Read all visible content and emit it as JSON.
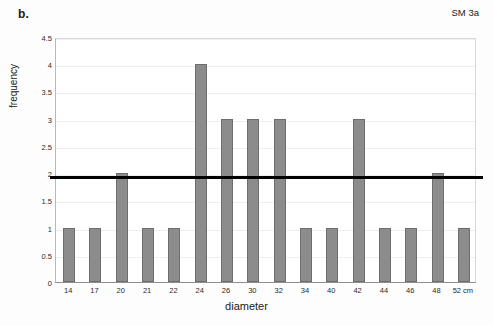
{
  "figure": {
    "panel_label": "b.",
    "series_tag": "SM 3a"
  },
  "chart_data": {
    "type": "bar",
    "title": "",
    "subtitle": "",
    "xlabel": "diameter",
    "ylabel": "frequency",
    "categories": [
      "14",
      "17",
      "20",
      "21",
      "22",
      "24",
      "26",
      "30",
      "32",
      "34",
      "40",
      "42",
      "44",
      "46",
      "48",
      "52 cm"
    ],
    "values": [
      1,
      1,
      2,
      1,
      1,
      4,
      3,
      3,
      3,
      1,
      1,
      3,
      1,
      1,
      2,
      1
    ],
    "ylim": [
      0,
      4.5
    ],
    "yticks": [
      0,
      0.5,
      1,
      1.5,
      2,
      2.5,
      3,
      3.5,
      4,
      4.5
    ],
    "ytick_labels": [
      "0",
      "0.5",
      "1",
      "1.5",
      "2",
      "2.5",
      "3",
      "3.5",
      "4",
      "4.5"
    ],
    "grid": true,
    "legend": "none",
    "annotations": [
      {
        "name": "series-tag",
        "text": "SM 3a",
        "position": "top-right"
      }
    ],
    "reference_line": {
      "value": 1.94,
      "orientation": "horizontal",
      "color": "#000000",
      "width_px": 3,
      "label": ""
    },
    "colors": {
      "bar_fill": "#8c8c8c",
      "bar_stroke": "#6d6d6d",
      "gridline": "#efefef",
      "axis": "#8e8e8e",
      "text": "#1a1a1a"
    }
  }
}
